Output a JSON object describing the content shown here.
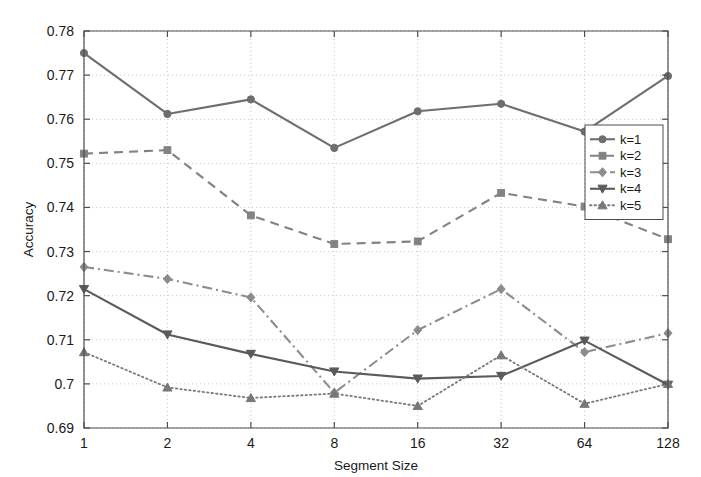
{
  "chart_data": {
    "type": "line",
    "title": "",
    "xlabel": "Segment Size",
    "ylabel": "Accuracy",
    "x": [
      1,
      2,
      4,
      8,
      16,
      32,
      64,
      128
    ],
    "categories": [
      "1",
      "2",
      "4",
      "8",
      "16",
      "32",
      "64",
      "128"
    ],
    "xscale": "log2-categorical",
    "ylim": [
      0.69,
      0.78
    ],
    "yticks": [
      0.69,
      0.7,
      0.71,
      0.72,
      0.73,
      0.74,
      0.75,
      0.76,
      0.77,
      0.78
    ],
    "ytick_labels": [
      "0.69",
      "0.7",
      "0.71",
      "0.72",
      "0.73",
      "0.74",
      "0.75",
      "0.76",
      "0.77",
      "0.78"
    ],
    "grid": true,
    "grid_style": "dotted",
    "legend_position": "center-right",
    "series": [
      {
        "name": "k=1",
        "values": [
          0.775,
          0.7612,
          0.7645,
          0.7535,
          0.7618,
          0.7635,
          0.7572,
          0.7698
        ],
        "line_style": "solid",
        "marker": "circle",
        "color": "#6e6e6e"
      },
      {
        "name": "k=2",
        "values": [
          0.7522,
          0.753,
          0.7382,
          0.7317,
          0.7323,
          0.7433,
          0.7402,
          0.7328
        ],
        "line_style": "dashed",
        "marker": "square",
        "color": "#828282"
      },
      {
        "name": "k=3",
        "values": [
          0.7265,
          0.7238,
          0.7196,
          0.698,
          0.7122,
          0.7215,
          0.7072,
          0.7115
        ],
        "line_style": "dashdot",
        "marker": "diamond",
        "color": "#8c8c8c"
      },
      {
        "name": "k=4",
        "values": [
          0.7215,
          0.7112,
          0.7068,
          0.7028,
          0.7012,
          0.7018,
          0.7098,
          0.6998
        ],
        "line_style": "solid",
        "marker": "triangle-down",
        "color": "#5a5a5a"
      },
      {
        "name": "k=5",
        "values": [
          0.7072,
          0.6992,
          0.6968,
          0.6978,
          0.695,
          0.7065,
          0.6955,
          0.7
        ],
        "line_style": "dotted",
        "marker": "triangle-up",
        "color": "#787878"
      }
    ]
  },
  "legend": {
    "entries": [
      "k=1",
      "k=2",
      "k=3",
      "k=4",
      "k=5"
    ]
  },
  "axes": {
    "x_title": "Segment Size",
    "y_title": "Accuracy"
  },
  "colors": {
    "axis": "#4d4d4d",
    "grid": "#c8c8c8",
    "background": "#ffffff",
    "text": "#1a1a1a"
  }
}
